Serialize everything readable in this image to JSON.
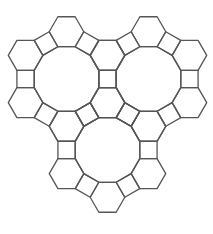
{
  "figure": {
    "width": 213,
    "height": 234,
    "background": "#ffffff",
    "stroke_color": "#555555",
    "stroke_width": 1.3,
    "edge_length": 17.3,
    "dodecagons": [
      {
        "name": "left",
        "cx": 66.5,
        "cy": 79
      },
      {
        "name": "right",
        "cx": 148.5,
        "cy": 79
      },
      {
        "name": "bottom",
        "cx": 107.5,
        "cy": 150
      }
    ],
    "counts": {
      "dodecagons": 3,
      "hexagons": 12,
      "squares": 15
    }
  }
}
